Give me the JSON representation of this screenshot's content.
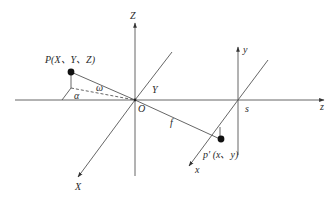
{
  "colors": {
    "line": "#555555",
    "dot": "#111111",
    "text": "#2a2a2a",
    "background": "#ffffff"
  },
  "labels": {
    "world_z_axis": "Z",
    "world_y_axis": "Y",
    "world_x_axis": "X",
    "origin": "O",
    "point_P": "P(X、Y、Z)",
    "angle_alpha": "α",
    "angle_omega": "ω",
    "focal_length": "f",
    "image_y_axis": "y",
    "image_x_axis": "x",
    "image_center": "s",
    "optical_z_axis": "z",
    "point_p_prime": "p′ (x、y)"
  }
}
